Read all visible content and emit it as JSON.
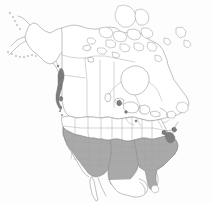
{
  "figure": {
    "kind": "distribution-range-map",
    "region": "North America",
    "title": "",
    "caption": "",
    "width_px": 212,
    "height_px": 203,
    "background_color": "#fdfdfd"
  },
  "legend": {
    "present": false,
    "entries": [
      {
        "key": "range-shaded",
        "label": "",
        "color": "#a9a9a9"
      },
      {
        "key": "range-dense",
        "label": "",
        "color": "#7e7e7e"
      },
      {
        "key": "no-range",
        "label": "",
        "color": "#ffffff"
      }
    ]
  },
  "styles": {
    "range_fill": "#a9a9a9",
    "range_fill_dark": "#7e7e7e",
    "absent_fill": "#ffffff",
    "boundary_line": "#8f8f8f",
    "subdivision_line": "#a0a0a0",
    "coast_line": "#8a8a8a"
  },
  "countries": [
    {
      "name": "Canada",
      "shaded": false
    },
    {
      "name": "United States",
      "shaded": true
    },
    {
      "name": "Mexico",
      "shaded": false
    },
    {
      "name": "Greenland",
      "shaded": false
    }
  ],
  "shaded_subdivisions": [
    "Washington",
    "Oregon",
    "California",
    "Nevada",
    "Idaho",
    "Utah",
    "Arizona",
    "New Mexico",
    "Colorado",
    "Kansas",
    "Oklahoma",
    "Texas",
    "Missouri",
    "Arkansas",
    "Louisiana",
    "Mississippi",
    "Alabama",
    "Tennessee",
    "Kentucky",
    "Georgia",
    "Florida",
    "South Carolina",
    "North Carolina",
    "Virginia",
    "West Virginia",
    "Maryland",
    "Delaware",
    "New Jersey",
    "Pennsylvania",
    "Illinois",
    "Indiana",
    "Ohio"
  ],
  "unshaded_subdivisions": [
    "Alaska",
    "Montana",
    "Wyoming",
    "North Dakota",
    "South Dakota",
    "Nebraska",
    "Minnesota",
    "Iowa",
    "Wisconsin",
    "Michigan",
    "New York",
    "Vermont",
    "New Hampshire",
    "Maine",
    "Massachusetts",
    "British Columbia",
    "Alberta",
    "Saskatchewan",
    "Manitoba",
    "Ontario",
    "Quebec",
    "Newfoundland and Labrador",
    "Nunavut",
    "Northwest Territories",
    "Yukon"
  ],
  "dense_patches": [
    {
      "region": "Pacific Northwest coast",
      "color": "#7e7e7e"
    },
    {
      "region": "Mid-Atlantic coast",
      "color": "#7e7e7e"
    }
  ],
  "features": {
    "hudson_bay": "Hudson Bay",
    "great_lakes": "Great Lakes",
    "gulf_of_mexico": "Gulf of Mexico",
    "baja_california": "Baja California",
    "aleutian_islands": "Aleutian Islands",
    "arctic_archipelago": "Canadian Arctic Archipelago",
    "newfoundland": "Newfoundland",
    "vancouver_island": "Vancouver Island",
    "florida_peninsula": "Florida Peninsula"
  }
}
